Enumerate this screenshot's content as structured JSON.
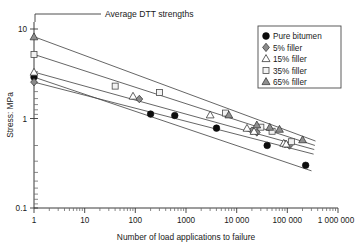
{
  "chart_data": {
    "type": "scatter",
    "title": "",
    "xlabel": "Number of load applications to failure",
    "ylabel": "Stress: MPa",
    "xscale": "log",
    "yscale": "log",
    "xlim": [
      1,
      1000000
    ],
    "ylim": [
      0.1,
      10
    ],
    "grid": false,
    "legend_position": "top-right",
    "xticklabels": [
      "1",
      "10",
      "100",
      "1000",
      "10 000",
      "100 000",
      "1 000 000"
    ],
    "xtickvalues": [
      1,
      10,
      100,
      1000,
      10000,
      100000,
      1000000
    ],
    "yticklabels": [
      "0.1",
      "1",
      "10"
    ],
    "ytickvalues": [
      0.1,
      1,
      10
    ],
    "annotations": [
      {
        "text": "Average DTT strengths",
        "points_to": "stress intercepts at N = 1",
        "x": 1,
        "y": 10
      }
    ],
    "series": [
      {
        "name": "Pure bitumen",
        "marker": "filled-circle",
        "color": "#0d0d0d",
        "dtt_strength_at_N1": 2.9,
        "trendline": {
          "x": [
            1,
            300000
          ],
          "y": [
            2.9,
            0.26
          ]
        },
        "points": [
          {
            "x": 200,
            "y": 1.12
          },
          {
            "x": 600,
            "y": 1.08
          },
          {
            "x": 4000,
            "y": 0.78
          },
          {
            "x": 40000,
            "y": 0.5
          },
          {
            "x": 230000,
            "y": 0.3
          }
        ]
      },
      {
        "name": "5% filler",
        "marker": "filled-diamond",
        "color": "#8a8a8a",
        "dtt_strength_at_N1": 2.55,
        "trendline": {
          "x": [
            1,
            330000
          ],
          "y": [
            2.55,
            0.4
          ]
        },
        "points": [
          {
            "x": 120,
            "y": 1.65
          },
          {
            "x": 20000,
            "y": 0.73
          },
          {
            "x": 25000,
            "y": 0.7
          },
          {
            "x": 90000,
            "y": 0.52
          },
          {
            "x": 110000,
            "y": 0.5
          }
        ]
      },
      {
        "name": "15% filler",
        "marker": "open-triangle",
        "color": "#ffffff",
        "dtt_strength_at_N1": 3.3,
        "trendline": {
          "x": [
            1,
            340000
          ],
          "y": [
            3.3,
            0.45
          ]
        },
        "points": [
          {
            "x": 90,
            "y": 1.78
          },
          {
            "x": 3000,
            "y": 1.1
          },
          {
            "x": 16000,
            "y": 0.78
          },
          {
            "x": 22000,
            "y": 0.72
          },
          {
            "x": 85000,
            "y": 0.53
          },
          {
            "x": 95000,
            "y": 0.52
          }
        ]
      },
      {
        "name": "35% filler",
        "marker": "open-square",
        "color": "#f2f2f2",
        "dtt_strength_at_N1": 5.2,
        "trendline": {
          "x": [
            1,
            350000
          ],
          "y": [
            5.2,
            0.5
          ]
        },
        "points": [
          {
            "x": 40,
            "y": 2.3
          },
          {
            "x": 300,
            "y": 1.95
          },
          {
            "x": 6000,
            "y": 1.15
          },
          {
            "x": 30000,
            "y": 0.8
          },
          {
            "x": 50000,
            "y": 0.72
          },
          {
            "x": 120000,
            "y": 0.55
          }
        ]
      },
      {
        "name": "65% filler",
        "marker": "filled-triangle",
        "color": "#8f8f8f",
        "dtt_strength_at_N1": 8.2,
        "trendline": {
          "x": [
            1,
            360000
          ],
          "y": [
            8.2,
            0.56
          ]
        },
        "points": [
          {
            "x": 7000,
            "y": 1.1
          },
          {
            "x": 25000,
            "y": 0.85
          },
          {
            "x": 45000,
            "y": 0.8
          },
          {
            "x": 70000,
            "y": 0.76
          },
          {
            "x": 200000,
            "y": 0.58
          }
        ]
      }
    ]
  },
  "legend": {
    "items": [
      {
        "label": "Pure bitumen",
        "marker": "filled-circle"
      },
      {
        "label": "5% filler",
        "marker": "filled-diamond"
      },
      {
        "label": "15% filler",
        "marker": "open-triangle"
      },
      {
        "label": "35% filler",
        "marker": "open-square"
      },
      {
        "label": "65% filler",
        "marker": "filled-triangle"
      }
    ]
  }
}
